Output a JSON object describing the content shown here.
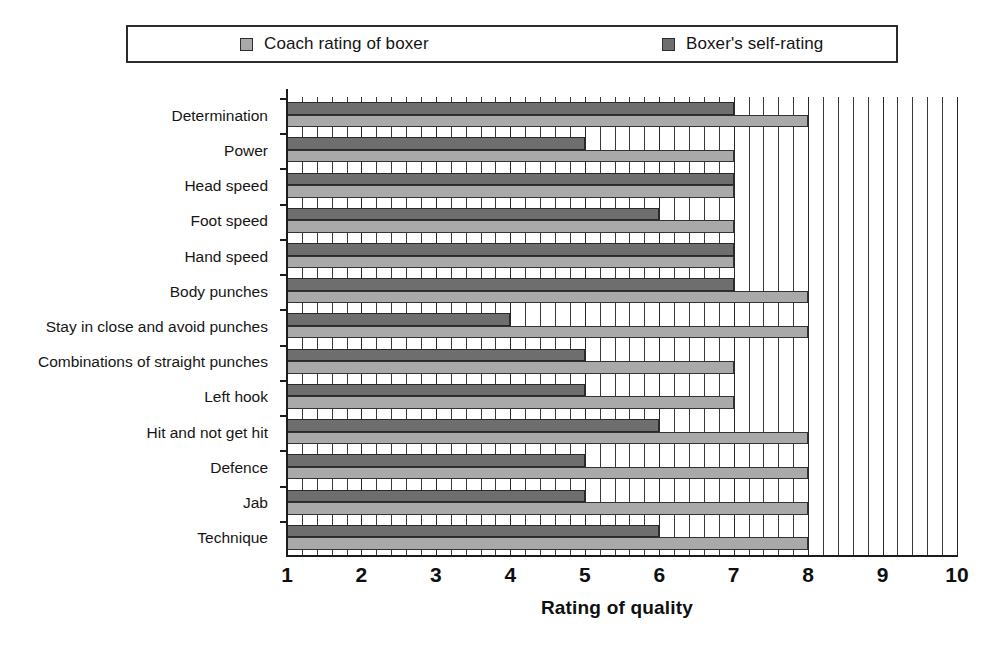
{
  "legend": {
    "position": "top",
    "entries": [
      {
        "label": "Coach rating of boxer",
        "color": "#a9a9a9",
        "name": "coach"
      },
      {
        "label": "Boxer's self-rating",
        "color": "#6e6e6e",
        "name": "self"
      }
    ]
  },
  "chart_data": {
    "type": "bar",
    "orientation": "horizontal",
    "title": "",
    "xlabel": "Rating of quality",
    "ylabel": "",
    "xlim": [
      1,
      10
    ],
    "xticks": [
      "1",
      "2",
      "3",
      "4",
      "5",
      "6",
      "7",
      "8",
      "9",
      "10"
    ],
    "grid": true,
    "grid_minor_step": 0.2,
    "legend_position": "top",
    "categories": [
      "Determination",
      "Power",
      "Head speed",
      "Foot speed",
      "Hand speed",
      "Body punches",
      "Stay in close and avoid punches",
      "Combinations of straight punches",
      "Left hook",
      "Hit and not get hit",
      "Defence",
      "Jab",
      "Technique"
    ],
    "series": [
      {
        "name": "Boxer's self-rating",
        "color": "#6e6e6e",
        "values": [
          7,
          5,
          7,
          6,
          7,
          7,
          4,
          5,
          5,
          6,
          5,
          5,
          6
        ]
      },
      {
        "name": "Coach rating of boxer",
        "color": "#a9a9a9",
        "values": [
          8,
          7,
          7,
          7,
          7,
          8,
          8,
          7,
          7,
          8,
          8,
          8,
          8
        ]
      }
    ]
  }
}
